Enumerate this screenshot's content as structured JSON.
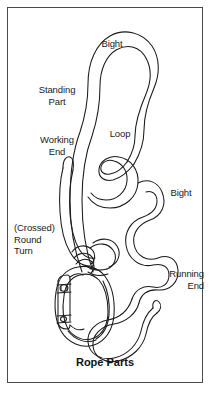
{
  "figure": {
    "title": "Rope Parts",
    "domain_kind": "line-art-diagram",
    "background_color": "#ffffff",
    "border_color": "#4a4a4a",
    "stroke_color": "#1a1a1a",
    "text_color": "#1a1a1a"
  },
  "labels": {
    "bight_top": "Bight",
    "standing_part": "Standing\nPart",
    "loop": "Loop",
    "working_end": "Working\nEnd",
    "bight_lower": "Bight",
    "crossed_round_turn": "(Crossed)\nRound\nTurn",
    "running_end": "Running\nEnd"
  },
  "parts": [
    {
      "name": "bight-top",
      "label": "Bight"
    },
    {
      "name": "standing-part",
      "label": "Standing Part"
    },
    {
      "name": "loop",
      "label": "Loop"
    },
    {
      "name": "working-end",
      "label": "Working End"
    },
    {
      "name": "bight-lower",
      "label": "Bight"
    },
    {
      "name": "crossed-round-turn",
      "label": "(Crossed) Round Turn"
    },
    {
      "name": "running-end",
      "label": "Running End"
    }
  ],
  "illustration": {
    "carabiner": "oval-locking-carabiner",
    "rope": "single-rope-line-drawing"
  }
}
